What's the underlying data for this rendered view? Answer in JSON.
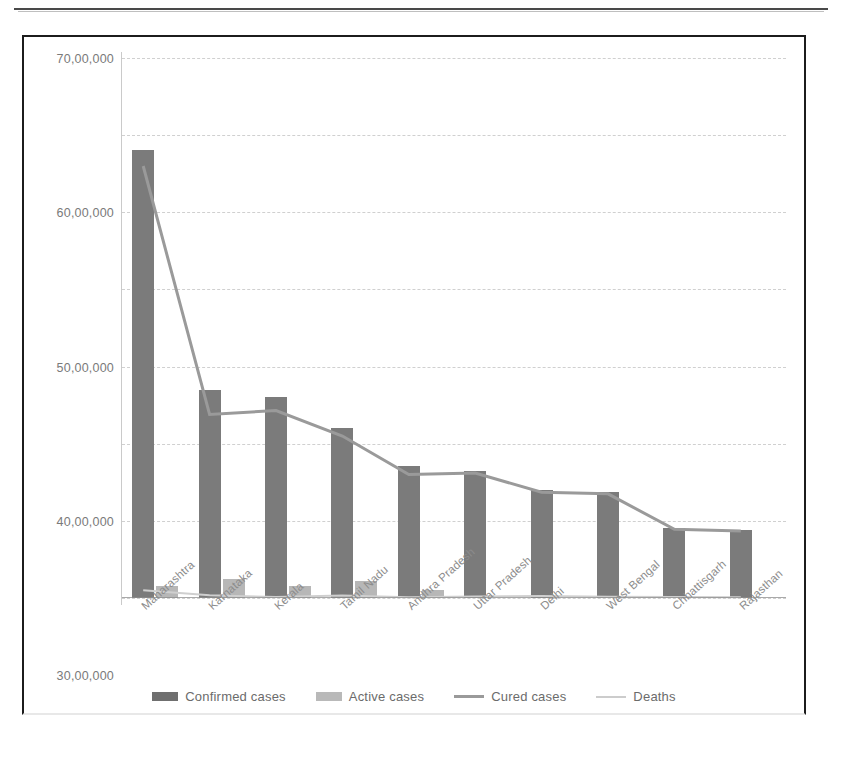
{
  "chart_data": {
    "type": "bar",
    "title": "",
    "xlabel": "",
    "ylabel": "",
    "ylim": [
      0,
      7000000
    ],
    "ytick_step": 1000000,
    "grid": true,
    "legend_position": "bottom",
    "ytick_labels": [
      "70,00,000",
      "60,00,000",
      "50,00,000",
      "40,00,000",
      "30,00,000",
      "20,00,000",
      "10,00,000",
      "0"
    ],
    "ytick_values": [
      7000000,
      6000000,
      5000000,
      4000000,
      3000000,
      2000000,
      1000000,
      0
    ],
    "categories": [
      "Maharashtra",
      "Karnataka",
      "Kerala",
      "Tamil Nadu",
      "Andhra Pradesh",
      "Uttar Pradesh",
      "Delhi",
      "West Bengal",
      "Chhattisgarh",
      "Rajasthan"
    ],
    "series": [
      {
        "name": "Confirmed cases",
        "kind": "bar",
        "color": "#7b7b7b",
        "values": [
          5810000,
          2700000,
          2600000,
          2200000,
          1710000,
          1650000,
          1400000,
          1380000,
          910000,
          880000
        ]
      },
      {
        "name": "Active cases",
        "kind": "bar",
        "color": "#b7b7b7",
        "values": [
          160000,
          250000,
          150000,
          220000,
          110000,
          0,
          0,
          0,
          0,
          0
        ]
      },
      {
        "name": "Cured cases",
        "kind": "line",
        "color": "#9a9a9a",
        "values": [
          5600000,
          2380000,
          2430000,
          2100000,
          1600000,
          1620000,
          1370000,
          1350000,
          890000,
          870000
        ]
      },
      {
        "name": "Deaths",
        "kind": "line",
        "color": "#cfcfcf",
        "values": [
          100000,
          35000,
          12000,
          33000,
          11000,
          21000,
          25000,
          17000,
          13000,
          9000
        ]
      }
    ]
  },
  "legend": {
    "items": [
      {
        "label": "Confirmed cases",
        "type": "swatch",
        "class": "confirmed"
      },
      {
        "label": "Active cases",
        "type": "swatch",
        "class": "active"
      },
      {
        "label": "Cured cases",
        "type": "line",
        "class": "cured"
      },
      {
        "label": "Deaths",
        "type": "line",
        "class": "deaths"
      }
    ]
  }
}
